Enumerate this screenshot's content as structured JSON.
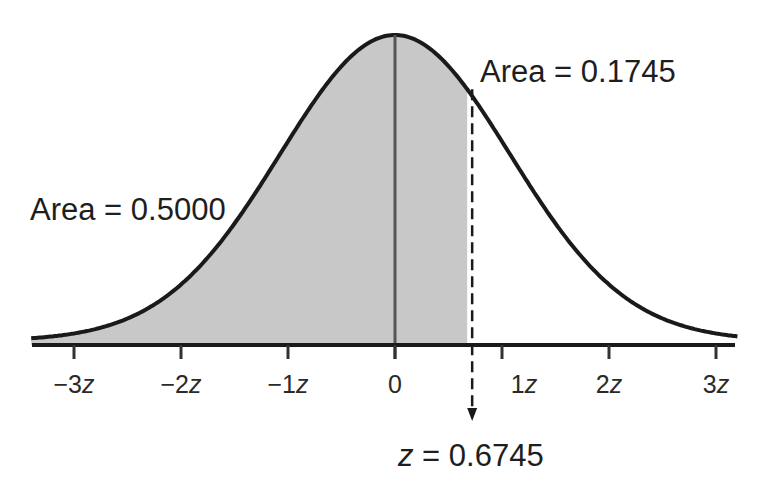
{
  "chart_data": {
    "type": "area",
    "title": "",
    "xlabel": "",
    "ylabel": "",
    "x_ticks": [
      {
        "value": -3,
        "label": "−3z"
      },
      {
        "value": -2,
        "label": "−2z"
      },
      {
        "value": -1,
        "label": "−1z"
      },
      {
        "value": 0,
        "label": "0"
      },
      {
        "value": 1,
        "label": "1z"
      },
      {
        "value": 2,
        "label": "2z"
      },
      {
        "value": 3,
        "label": "3z"
      }
    ],
    "xlim": [
      -3.4,
      3.2
    ],
    "grid": false,
    "shaded_region": {
      "from": -3.4,
      "to": 0.6745,
      "color": "#c8c8c8"
    },
    "annotations": [
      {
        "text": "Area = 0.5000",
        "refers_to": "left half (z < 0)"
      },
      {
        "text": "Area = 0.1745",
        "refers_to": "0 < z < 0.6745"
      },
      {
        "text": "z = 0.6745",
        "refers_to": "dashed marker"
      }
    ],
    "marker": {
      "z": 0.6745,
      "style": "dashed",
      "arrow": "down"
    },
    "colors": {
      "curve": "#1a1a1a",
      "fill": "#c8c8c8",
      "axis": "#1a1a1a"
    }
  },
  "labels": {
    "area_left": "Area = 0.5000",
    "area_right": "Area = 0.1745",
    "z_prefix": "z",
    "z_value": " = 0.6745",
    "ticks": [
      {
        "num": "−3",
        "unit": "z"
      },
      {
        "num": "−2",
        "unit": "z"
      },
      {
        "num": "−1",
        "unit": "z"
      },
      {
        "num": "0",
        "unit": ""
      },
      {
        "num": "1",
        "unit": "z"
      },
      {
        "num": "2",
        "unit": "z"
      },
      {
        "num": "3",
        "unit": "z"
      }
    ]
  }
}
